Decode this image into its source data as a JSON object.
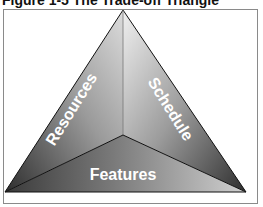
{
  "figure": {
    "title": "Figure 1-5   The Trade-off Triangle"
  },
  "diagram": {
    "type": "triangle",
    "faces": [
      {
        "label": "Resources",
        "position": "left"
      },
      {
        "label": "Schedule",
        "position": "right"
      },
      {
        "label": "Features",
        "position": "bottom"
      }
    ],
    "colors": {
      "dark": "#3a3a3a",
      "mid": "#8c8c8c",
      "light": "#e6e6e6",
      "edge": "#111111",
      "frame": "#8a8a8a"
    }
  }
}
